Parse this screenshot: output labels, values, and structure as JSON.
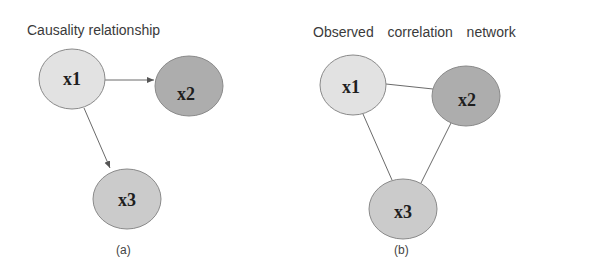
{
  "panels": [
    {
      "id": "a",
      "title": "Causality relationship",
      "caption": "(a)",
      "edge_type": "directed",
      "nodes": [
        {
          "id": "x1",
          "label": "x1",
          "cx": 72,
          "cy": 79,
          "rx": 33,
          "ry": 30,
          "fill": "#e2e2e2"
        },
        {
          "id": "x2",
          "label": "x2",
          "cx": 189,
          "cy": 86,
          "rx": 34,
          "ry": 30,
          "fill": "#adadad"
        },
        {
          "id": "x3",
          "label": "x3",
          "cx": 127,
          "cy": 199,
          "rx": 34,
          "ry": 30,
          "fill": "#cbcbcb"
        }
      ],
      "edges": [
        {
          "from": "x1",
          "to": "x2"
        },
        {
          "from": "x1",
          "to": "x3"
        }
      ]
    },
    {
      "id": "b",
      "title": "Observed  correlation  network",
      "caption": "(b)",
      "edge_type": "undirected",
      "nodes": [
        {
          "id": "x1",
          "label": "x1",
          "cx": 58,
          "cy": 85,
          "rx": 33,
          "ry": 30,
          "fill": "#e2e2e2"
        },
        {
          "id": "x2",
          "label": "x2",
          "cx": 171,
          "cy": 96,
          "rx": 34,
          "ry": 30,
          "fill": "#adadad"
        },
        {
          "id": "x3",
          "label": "x3",
          "cx": 108,
          "cy": 209,
          "rx": 34,
          "ry": 30,
          "fill": "#cbcbcb"
        }
      ],
      "edges": [
        {
          "from": "x1",
          "to": "x2"
        },
        {
          "from": "x1",
          "to": "x3"
        },
        {
          "from": "x2",
          "to": "x3"
        }
      ]
    }
  ],
  "colors": {
    "edge": "#6a6a6a",
    "node_stroke": "#8a8a8a"
  }
}
